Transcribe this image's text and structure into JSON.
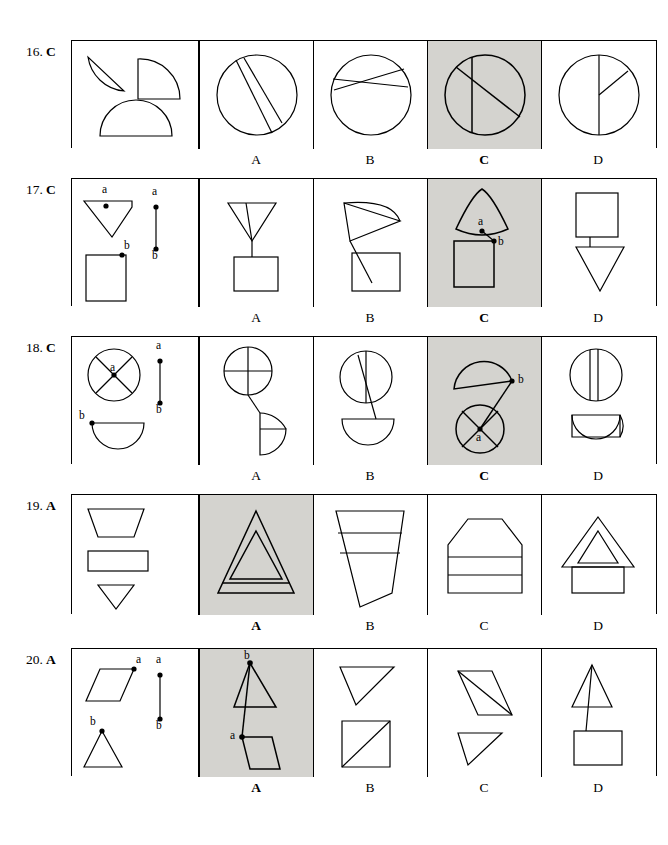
{
  "page": {
    "width": 668,
    "height": 845,
    "shaded_color": "#d4d3cf",
    "line_color": "#000000"
  },
  "questions": [
    {
      "number": "16.",
      "answer": "C",
      "top": 40,
      "row_height": 108,
      "stem_width": 128,
      "option_width": 114,
      "options": [
        {
          "label": "A",
          "correct": false
        },
        {
          "label": "B",
          "correct": false
        },
        {
          "label": "C",
          "correct": true
        },
        {
          "label": "D",
          "correct": false
        }
      ]
    },
    {
      "number": "17.",
      "answer": "C",
      "top": 178,
      "row_height": 128,
      "stem_width": 128,
      "option_width": 114,
      "options": [
        {
          "label": "A",
          "correct": false
        },
        {
          "label": "B",
          "correct": false
        },
        {
          "label": "C",
          "correct": true
        },
        {
          "label": "D",
          "correct": false
        }
      ]
    },
    {
      "number": "18.",
      "answer": "C",
      "top": 336,
      "row_height": 128,
      "stem_width": 128,
      "option_width": 114,
      "options": [
        {
          "label": "A",
          "correct": false
        },
        {
          "label": "B",
          "correct": false
        },
        {
          "label": "C",
          "correct": true
        },
        {
          "label": "D",
          "correct": false
        }
      ]
    },
    {
      "number": "19.",
      "answer": "A",
      "top": 494,
      "row_height": 120,
      "stem_width": 128,
      "option_width": 114,
      "options": [
        {
          "label": "A",
          "correct": true
        },
        {
          "label": "B",
          "correct": false
        },
        {
          "label": "C",
          "correct": false
        },
        {
          "label": "D",
          "correct": false
        }
      ]
    },
    {
      "number": "20.",
      "answer": "A",
      "top": 648,
      "row_height": 128,
      "stem_width": 128,
      "option_width": 114,
      "options": [
        {
          "label": "A",
          "correct": true
        },
        {
          "label": "B",
          "correct": false
        },
        {
          "label": "C",
          "correct": false
        },
        {
          "label": "D",
          "correct": false
        }
      ]
    }
  ],
  "point_labels": {
    "a": "a",
    "b": "b"
  }
}
